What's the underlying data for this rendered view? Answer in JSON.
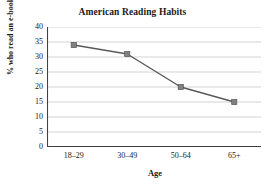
{
  "chart_data": {
    "type": "line",
    "title": "American Reading Habits",
    "xlabel": "Age",
    "ylabel": "% who read an e-book",
    "categories": [
      "18–29",
      "30–49",
      "50–64",
      "65+"
    ],
    "values": [
      34,
      31,
      20,
      15
    ],
    "series": [
      {
        "name": "% who read an e-book",
        "values": [
          34,
          31,
          20,
          15
        ]
      }
    ],
    "ylim": [
      0,
      40
    ],
    "ytick_labels": [
      "40",
      "35",
      "30",
      "25",
      "20",
      "15",
      "10",
      "5",
      "0"
    ],
    "ytick_values": [
      40,
      35,
      30,
      25,
      20,
      15,
      10,
      5,
      0
    ],
    "ystep": 5,
    "grid": "horizontal",
    "legend": "none",
    "marker": "square",
    "colors": {
      "line": "#595959",
      "marker": "#808080",
      "marker_edge": "#595959",
      "gridline": "#c8c8c8",
      "axis": "#404040",
      "text": "#1a1a1a",
      "background": "#ffffff"
    }
  }
}
